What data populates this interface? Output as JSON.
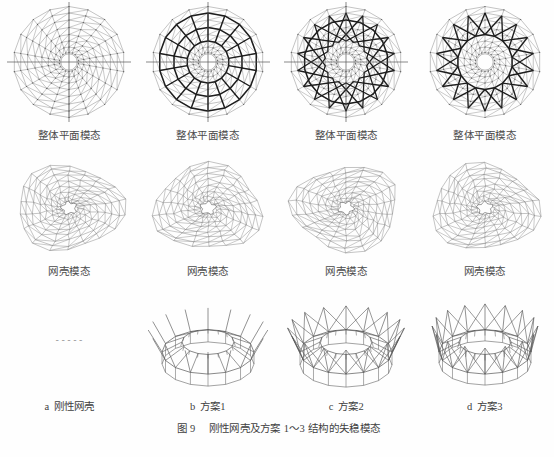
{
  "figure": {
    "number": "图 9",
    "title": "刚性网壳及方案 1～3 结构的失稳模态",
    "title_full": "图 9　刚性网壳及方案 1～3 结构的失稳模态"
  },
  "rows": [
    {
      "row_name": "overall-plane-mode",
      "cells": [
        {
          "label": "整体平面模态",
          "art": "plan-plain"
        },
        {
          "label": "整体平面模态",
          "art": "plan-rings"
        },
        {
          "label": "整体平面模态",
          "art": "plan-star"
        },
        {
          "label": "整体平面模态",
          "art": "plan-zigzag"
        }
      ]
    },
    {
      "row_name": "latticed-shell-mode",
      "cells": [
        {
          "label": "网壳模态",
          "art": "shell-a"
        },
        {
          "label": "网壳模态",
          "art": "shell-b"
        },
        {
          "label": "网壳模态",
          "art": "shell-c"
        },
        {
          "label": "网壳模态",
          "art": "shell-d"
        }
      ]
    },
    {
      "row_name": "cable-strut-perspective",
      "cells": [
        {
          "label": "-----",
          "art": "none"
        },
        {
          "label": "",
          "art": "ring-b"
        },
        {
          "label": "",
          "art": "ring-c"
        },
        {
          "label": "",
          "art": "ring-d"
        }
      ]
    }
  ],
  "captions": [
    {
      "letter": "a",
      "text": "刚性网壳"
    },
    {
      "letter": "b",
      "text": "方案1"
    },
    {
      "letter": "c",
      "text": "方案2"
    },
    {
      "letter": "d",
      "text": "方案3"
    }
  ],
  "colors": {
    "page_background": "#fefefe",
    "line_light": "#7c7c7c",
    "line_medium": "#565656",
    "line_bold": "#1d1d1d",
    "text": "#3f3f3f"
  }
}
